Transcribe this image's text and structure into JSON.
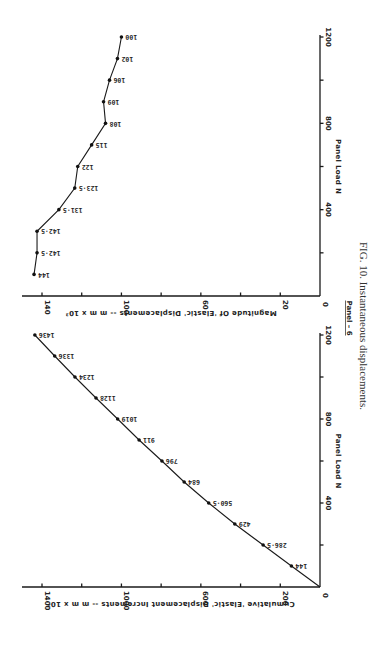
{
  "figure": {
    "caption": "FIG. 10.  Instantaneous displacements.",
    "panel_label": "Panel – 6",
    "orientation": "rotated 90° clockwise (landscape figure on portrait page)"
  },
  "chart_data": [
    {
      "type": "line",
      "title": "",
      "xlabel": "Panel  Load N",
      "ylabel": "Magnitude  Of 'Elastic' Displacements -- m m x 10³",
      "x_ticks": [
        0,
        400,
        800,
        1200
      ],
      "x_minor_ticks": [
        200,
        600,
        1000
      ],
      "y_ticks": [
        20,
        60,
        100,
        140
      ],
      "y_minor_ticks": [
        40,
        80,
        120
      ],
      "xlim": [
        0,
        1200
      ],
      "ylim": [
        0,
        150
      ],
      "grid": false,
      "x": [
        100,
        200,
        300,
        400,
        500,
        600,
        700,
        800,
        900,
        1000,
        1100,
        1200
      ],
      "values": [
        144,
        142.5,
        142.5,
        131.5,
        123.5,
        122,
        115,
        108,
        109,
        106,
        102,
        100
      ],
      "point_labels": [
        "144",
        "142·5",
        "142·5",
        "131·5",
        "123·5",
        "122",
        "115",
        "108",
        "109",
        "106",
        "102",
        "100"
      ]
    },
    {
      "type": "line",
      "title": "",
      "xlabel": "Panel  Load N",
      "ylabel": "Cumulative  'Elastic'  Displacement  Increments -- m m x 10³",
      "x_ticks": [
        0,
        400,
        800,
        1200
      ],
      "x_minor_ticks": [
        200,
        600,
        1000
      ],
      "y_ticks": [
        200,
        600,
        1000,
        1400
      ],
      "y_minor_ticks": [
        400,
        800,
        1200
      ],
      "xlim": [
        0,
        1200
      ],
      "ylim": [
        0,
        1500
      ],
      "grid": false,
      "x": [
        0,
        100,
        200,
        300,
        400,
        500,
        600,
        700,
        800,
        900,
        1000,
        1100,
        1200
      ],
      "values": [
        0,
        144,
        286.5,
        429,
        560.5,
        684,
        796,
        911,
        1019,
        1128,
        1234,
        1336,
        1436
      ],
      "point_labels": [
        "",
        "144",
        "286·5",
        "429",
        "560·5",
        "684",
        "796",
        "911",
        "1019",
        "1128",
        "1234",
        "1336",
        "1436"
      ]
    }
  ]
}
